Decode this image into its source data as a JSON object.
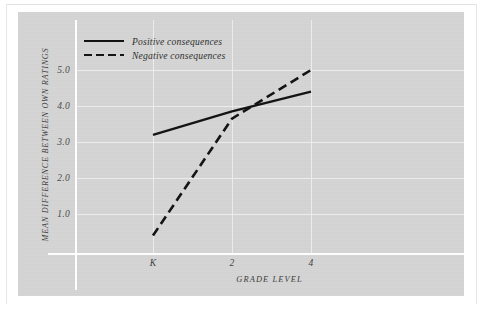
{
  "chart_data": {
    "type": "line",
    "title": "",
    "xlabel": "GRADE LEVEL",
    "ylabel": "MEAN DIFFERENCE BETWEEN OWN RATINGS",
    "x": [
      "K",
      "2",
      "4"
    ],
    "xticklabels": [
      "K",
      "2",
      "4"
    ],
    "yticklabels": [
      "1.0",
      "2.0",
      "3.0",
      "4.0",
      "5.0"
    ],
    "ylim": [
      0,
      5.6
    ],
    "ytick_values": [
      1.0,
      2.0,
      3.0,
      4.0,
      5.0
    ],
    "grid": true,
    "legend_position": "top-left",
    "series": [
      {
        "name": "Positive consequences",
        "style": "solid",
        "color": "#111111",
        "values": [
          3.2,
          3.85,
          4.4
        ]
      },
      {
        "name": "Negative consequences",
        "style": "dashed",
        "color": "#111111",
        "values": [
          0.4,
          3.65,
          5.0
        ]
      }
    ]
  },
  "legend": {
    "items": [
      {
        "label": "Positive consequences",
        "style": "solid"
      },
      {
        "label": "Negative consequences",
        "style": "dashed"
      }
    ]
  },
  "axes": {
    "y_title": "MEAN DIFFERENCE BETWEEN OWN RATINGS",
    "x_title": "GRADE LEVEL",
    "y_ticks": [
      "5.0",
      "4.0",
      "3.0",
      "2.0",
      "1.0"
    ],
    "x_ticks": [
      "K",
      "2",
      "4"
    ]
  },
  "colors": {
    "panel_background": "#d4d4d4",
    "page_background": "#ffffff",
    "gridline": "#ededed",
    "axis_line": "#ffffff",
    "series_line": "#111111",
    "tick_text": "#3d3d3d"
  }
}
